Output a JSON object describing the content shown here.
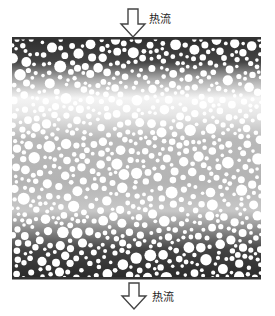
{
  "diagram": {
    "top_label": "热流",
    "bottom_label": "热流",
    "colors": {
      "plate": "#333333",
      "particle_fill": "#ffffff",
      "dark_matrix": "#3a3a3a",
      "light_matrix": "#b5b5b5",
      "arrow_fill": "#ffffff",
      "arrow_stroke": "#444444"
    },
    "plates": {
      "left": 12,
      "right": 261,
      "top_y": 38,
      "bottom_y": 278
    }
  }
}
